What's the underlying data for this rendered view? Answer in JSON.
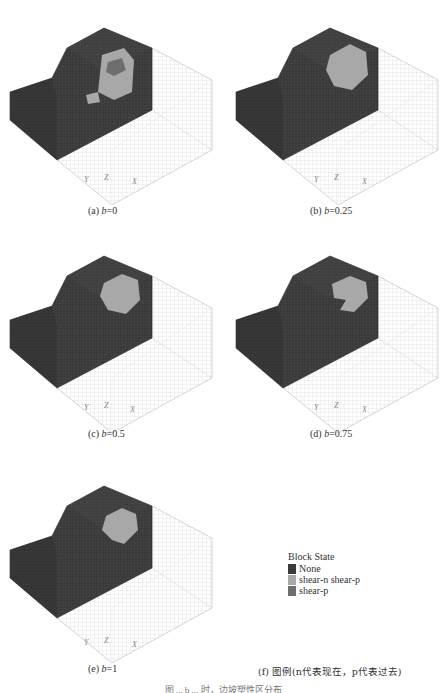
{
  "panels": [
    {
      "id": "a",
      "label_prefix": "(a) ",
      "var": "b",
      "label_suffix": "=0",
      "plastic_shape": "ring"
    },
    {
      "id": "b",
      "label_prefix": "(b) ",
      "var": "b",
      "label_suffix": "=0.25",
      "plastic_shape": "disc"
    },
    {
      "id": "c",
      "label_prefix": "(c) ",
      "var": "b",
      "label_suffix": "=0.5",
      "plastic_shape": "disc"
    },
    {
      "id": "d",
      "label_prefix": "(d) ",
      "var": "b",
      "label_suffix": "=0.75",
      "plastic_shape": "hook"
    },
    {
      "id": "e",
      "label_prefix": "(e) ",
      "var": "b",
      "label_suffix": "=1",
      "plastic_shape": "disc-small"
    }
  ],
  "axes": {
    "y": "Y",
    "z": "Z",
    "x": "X"
  },
  "legend": {
    "title": "Block State",
    "items": [
      {
        "label": "None",
        "color": "#3a3a3a"
      },
      {
        "label": "shear-n shear-p",
        "color": "#a8a8a8"
      },
      {
        "label": "shear-p",
        "color": "#6e6e6e"
      }
    ],
    "caption": "(f) 图例(n代表现在，p代表过去)"
  },
  "figure_caption": "图 ... b ... 时，边坡塑性区分布",
  "colors": {
    "mesh_dark": "#3a3a3a",
    "mesh_light": "#ffffff",
    "grid_line": "#c8c8c8",
    "plastic_now": "#a8a8a8",
    "plastic_past": "#6e6e6e"
  }
}
